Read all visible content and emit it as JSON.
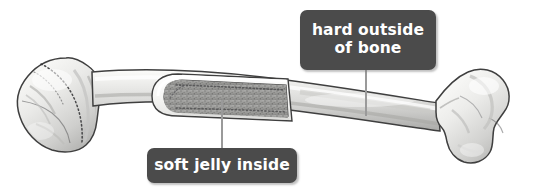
{
  "figure": {
    "background_color": "#ffffff",
    "width": 537,
    "height": 191
  },
  "callouts": [
    {
      "id": "hard-outside",
      "label": "hard outside\nof bone",
      "line1": "hard outside",
      "line2": "of bone",
      "box_color": "#4b4b4b",
      "text_color": "#ffffff",
      "leader_line_color": "#9a9a9a"
    },
    {
      "id": "soft-jelly",
      "label": "soft jelly inside",
      "box_color": "#4b4b4b",
      "text_color": "#ffffff",
      "leader_line_color": "#9a9a9a"
    }
  ],
  "illustration": {
    "bone_outline_color": "#3d3d3d",
    "cortical_light": "#f4f4f2",
    "cortical_mid": "#d2d2d0",
    "cortical_shadow": "#9c9c9a",
    "marrow_fill": "#9e9e9c",
    "marrow_speckle": "#6d6d6b",
    "cavity_rim": "#fbfbf9"
  }
}
